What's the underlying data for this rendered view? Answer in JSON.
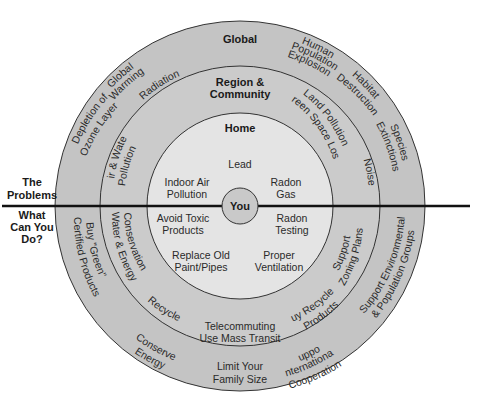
{
  "colors": {
    "outer_ring": "#c4c4c4",
    "middle_ring": "#cbcbcb",
    "home_ring": "#e4e4e4",
    "you_circle": "#c9c9c9",
    "stroke": "#333333",
    "divider": "#111111"
  },
  "side_labels": {
    "problems": [
      "The",
      "Problems"
    ],
    "actions": [
      "What",
      "Can You",
      "Do?"
    ]
  },
  "rings": {
    "global": {
      "title": "Global",
      "problems": [
        [
          "Global",
          "Warming"
        ],
        [
          "Depletion of",
          "Ozone Layer"
        ],
        [
          "Human",
          "Population",
          "Explosion"
        ],
        [
          "Habitat",
          "Destruction"
        ],
        [
          "Species",
          "Extinctions"
        ]
      ],
      "actions": [
        [
          "Buy \"Green\"",
          "Certified Products"
        ],
        [
          "Conserve",
          "Energy"
        ],
        [
          "Limit Your",
          "Family Size"
        ],
        [
          "Support",
          "International",
          "Cooperation"
        ],
        [
          "Support Environmental",
          "& Population Groups"
        ]
      ]
    },
    "region": {
      "title": [
        "Region &",
        "Community"
      ],
      "problems": [
        [
          "Radiation"
        ],
        [
          "Air & Water",
          "Pollution"
        ],
        [
          "Land Pollution",
          "Green Space Loss"
        ],
        [
          "Noise"
        ]
      ],
      "actions": [
        [
          "Water & Energy",
          "Conservation"
        ],
        [
          "Recycle"
        ],
        [
          "Telecommuting",
          "Use Mass Transit"
        ],
        [
          "Buy Recycled",
          "Products"
        ],
        [
          "Support",
          "Zoning Plans"
        ]
      ]
    },
    "home": {
      "title": "Home",
      "problems": [
        [
          "Lead"
        ],
        [
          "Indoor Air",
          "Pollution"
        ],
        [
          "Radon",
          "Gas"
        ]
      ],
      "actions": [
        [
          "Avoid Toxic",
          "Products"
        ],
        [
          "Radon",
          "Testing"
        ],
        [
          "Replace Old",
          "Paint/Pipes"
        ],
        [
          "Proper",
          "Ventilation"
        ]
      ]
    },
    "center": {
      "title": "You"
    }
  }
}
